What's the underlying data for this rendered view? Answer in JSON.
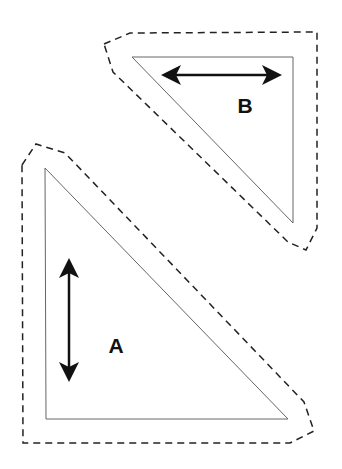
{
  "diagram": {
    "title": "",
    "shapes": [
      {
        "id": "A",
        "label": "A",
        "shape": "right-triangle",
        "arrow_orientation": "vertical",
        "outline": "dashed offset boundary"
      },
      {
        "id": "B",
        "label": "B",
        "shape": "right-triangle",
        "arrow_orientation": "horizontal",
        "outline": "dashed offset boundary"
      }
    ],
    "colors": {
      "line": "#666666",
      "arrow": "#111111",
      "dash": "#222222",
      "background": "#ffffff"
    }
  }
}
